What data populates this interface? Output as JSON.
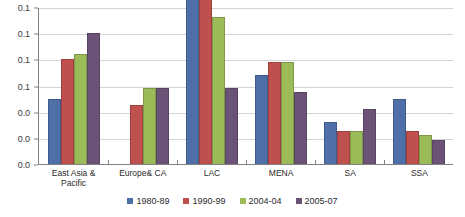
{
  "chart_data": {
    "type": "bar",
    "title": "",
    "xlabel": "",
    "ylabel": "",
    "ylim": [
      0.0,
      0.12
    ],
    "grid": true,
    "legend_position": "bottom",
    "categories": [
      "East Asia &\nPacific",
      "Europe& CA",
      "LAC",
      "MENA",
      "SA",
      "SSA"
    ],
    "ytick_labels": [
      "0.1",
      "0.1",
      "0.1",
      "0.1",
      "0.0",
      "0.0",
      "0.0"
    ],
    "ytick_values": [
      0.12,
      0.1,
      0.08,
      0.06,
      0.04,
      0.02,
      0.0
    ],
    "series": [
      {
        "name": "1980-89",
        "color": "#4f6fa8",
        "values": [
          0.05,
          0.0,
          0.176,
          0.068,
          0.032,
          0.05
        ]
      },
      {
        "name": "1990-99",
        "color": "#c0504d",
        "values": [
          0.08,
          0.045,
          0.158,
          0.078,
          0.025,
          0.025
        ]
      },
      {
        "name": "2004-04",
        "color": "#9bbb59",
        "values": [
          0.084,
          0.058,
          0.112,
          0.078,
          0.025,
          0.022
        ]
      },
      {
        "name": "2005-07",
        "color": "#6b5378",
        "values": [
          0.1,
          0.058,
          0.058,
          0.055,
          0.042,
          0.018
        ]
      }
    ]
  }
}
